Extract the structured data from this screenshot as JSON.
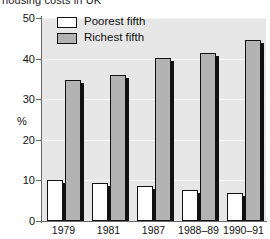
{
  "chart_data": {
    "type": "bar",
    "title": "housing costs in UK",
    "xlabel": "",
    "ylabel": "%",
    "ylim": [
      0,
      50
    ],
    "yticks": [
      0,
      10,
      20,
      30,
      40,
      50
    ],
    "ytick_labels": [
      "0",
      "10",
      "20",
      "30",
      "40",
      "50"
    ],
    "grid": true,
    "legend_position": "top-left",
    "categories": [
      "1979",
      "1981",
      "1987",
      "1988–89",
      "1990–91"
    ],
    "series": [
      {
        "name": "Poorest fifth",
        "color": "#ffffff",
        "values": [
          10.0,
          9.3,
          8.5,
          7.7,
          7.0
        ]
      },
      {
        "name": "Richest fifth",
        "color": "#b3b3b3",
        "values": [
          34.8,
          36.0,
          40.2,
          41.5,
          44.5
        ]
      }
    ]
  },
  "legend": {
    "items": [
      {
        "label": "Poorest fifth",
        "swatch": "poorest"
      },
      {
        "label": "Richest fifth",
        "swatch": "richest"
      }
    ]
  },
  "colors": {
    "plot_background": "#e7e7e7",
    "gridline": "#f4f4f4",
    "axis": "#6b6b6b",
    "bar_outline": "#111111",
    "richest_fill": "#b3b3b3",
    "poorest_fill": "#ffffff"
  }
}
